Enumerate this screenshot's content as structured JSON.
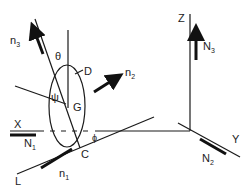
{
  "diagram": {
    "labels": {
      "n3": {
        "main": "n",
        "sub": "3"
      },
      "theta": "θ",
      "D": "D",
      "n2": {
        "main": "n",
        "sub": "2"
      },
      "psi": "ψ",
      "G": "G",
      "X": "X",
      "N1": {
        "main": "N",
        "sub": "1"
      },
      "phi": "ϕ",
      "C": "C",
      "L": "L",
      "n1": {
        "main": "n",
        "sub": "1"
      },
      "Z": "Z",
      "N3": {
        "main": "N",
        "sub": "3"
      },
      "Y": "Y",
      "N2": {
        "main": "N",
        "sub": "2"
      }
    },
    "colors": {
      "line": "#1a1a1a",
      "background": "#ffffff"
    }
  }
}
